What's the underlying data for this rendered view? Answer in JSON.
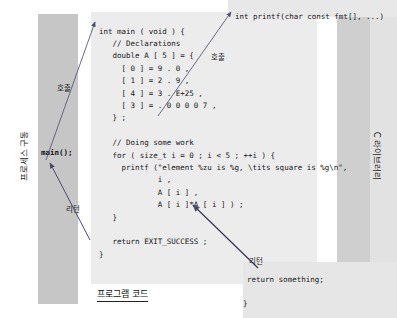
{
  "figure": {
    "title_caption": "프로그램 코드",
    "left_band_label": "프로세스 구동",
    "right_band_label": "C 라이브러리"
  },
  "process_column": {
    "main_call": "main();"
  },
  "annotations": {
    "call_left": "호출",
    "call_right": "호출",
    "return_left": "리턴",
    "return_right": "리턴"
  },
  "printf_declaration": {
    "signature": "int printf(char const fmt[], ...)"
  },
  "printf_body": {
    "return_line": "return something;",
    "close_brace": "}"
  },
  "program_code": {
    "lines": [
      "int main ( void ) {",
      "   // Declarations",
      "   double A [ 5 ] = {",
      "     [ 0 ] = 9 . 0 ,",
      "     [ 1 ] = 2 . 9 ,",
      "     [ 4 ] = 3 . E+25 ,",
      "     [ 3 ] = . 0 0 0 0 7 ,",
      "   } ;",
      "",
      "   // Doing some work",
      "   for ( size_t i = 0 ; i < 5 ; ++i ) {",
      "     printf (\"element %zu is %g, \\tits square is %g\\n\",",
      "             i ,",
      "             A [ i ] ,",
      "             A [ i ]*A [ i ] ) ;",
      "   }",
      "",
      "   return EXIT_SUCCESS ;",
      "}"
    ],
    "text": "int main ( void ) {\n   // Declarations\n   double A [ 5 ] = {\n     [ 0 ] = 9 . 0 ,\n     [ 1 ] = 2 . 9 ,\n     [ 4 ] = 3 . E+25 ,\n     [ 3 ] = . 0 0 0 0 7 ,\n   } ;\n\n   // Doing some work\n   for ( size_t i = 0 ; i < 5 ; ++i ) {\n     printf (\"element %zu is %g, \\tits square is %g\\n\",\n             i ,\n             A [ i ] ,\n             A [ i ]*A [ i ] ) ;\n   }\n\n   return EXIT_SUCCESS ;\n}"
  },
  "colors": {
    "band_gray": "#c6c6c6",
    "code_panel_gray": "#ececec",
    "library_gray": "#cfcfcf",
    "arrow_stroke": "#4a4a6a",
    "text": "#161616"
  }
}
